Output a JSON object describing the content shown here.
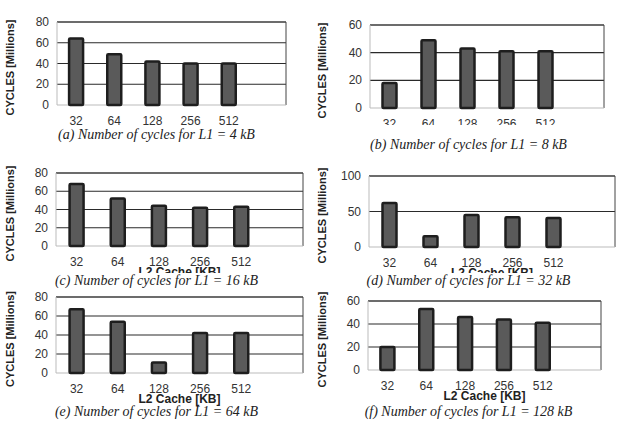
{
  "chart_data": [
    {
      "id": "a",
      "type": "bar",
      "title": "(a) Number of cycles for L1 = 4 kB",
      "xlabel": "L2 Cache [KB]",
      "ylabel": "CYCLES [Millions]",
      "categories": [
        "32",
        "64",
        "128",
        "256",
        "512"
      ],
      "values": [
        64,
        49,
        42,
        40,
        40
      ],
      "ylim": [
        0,
        80
      ],
      "yticks": [
        0,
        20,
        40,
        60,
        80
      ],
      "grid": true,
      "legend": null
    },
    {
      "id": "b",
      "type": "bar",
      "title": "(b) Number of cycles for L1 = 8 kB",
      "xlabel": "L2 Cache [KB]",
      "ylabel": "CYCLES [Millions]",
      "categories": [
        "32",
        "64",
        "128",
        "256",
        "512"
      ],
      "values": [
        18,
        49,
        43,
        41,
        41
      ],
      "ylim": [
        0,
        60
      ],
      "yticks": [
        0,
        20,
        40,
        60
      ],
      "grid": true,
      "legend": null
    },
    {
      "id": "c",
      "type": "bar",
      "title": "(c) Number of cycles for L1 = 16 kB",
      "xlabel": "L2 Cache [KB]",
      "ylabel": "CYCLES [Millions]",
      "categories": [
        "32",
        "64",
        "128",
        "256",
        "512"
      ],
      "values": [
        68,
        52,
        44,
        42,
        43
      ],
      "ylim": [
        0,
        80
      ],
      "yticks": [
        0,
        20,
        40,
        60,
        80
      ],
      "grid": true,
      "legend": null
    },
    {
      "id": "d",
      "type": "bar",
      "title": "(d) Number of cycles for L1 = 32 kB",
      "xlabel": "L2 Cache [KB]",
      "ylabel": "CYCLES [Millions]",
      "categories": [
        "32",
        "64",
        "128",
        "256",
        "512"
      ],
      "values": [
        62,
        15,
        45,
        42,
        41
      ],
      "ylim": [
        0,
        100
      ],
      "yticks": [
        0,
        50,
        100
      ],
      "grid": true,
      "legend": null
    },
    {
      "id": "e",
      "type": "bar",
      "title": "(e) Number of cycles for L1 = 64 kB",
      "xlabel": "L2 Cache [KB]",
      "ylabel": "CYCLES [Millions]",
      "categories": [
        "32",
        "64",
        "128",
        "256",
        "512"
      ],
      "values": [
        67,
        54,
        11,
        42,
        42
      ],
      "ylim": [
        0,
        80
      ],
      "yticks": [
        0,
        20,
        40,
        60,
        80
      ],
      "grid": true,
      "legend": null
    },
    {
      "id": "f",
      "type": "bar",
      "title": "(f) Number of cycles for L1 = 128 kB",
      "xlabel": "L2 Cache [KB]",
      "ylabel": "CYCLES [Millions]",
      "categories": [
        "32",
        "64",
        "128",
        "256",
        "512"
      ],
      "values": [
        20,
        53,
        46,
        44,
        41
      ],
      "ylim": [
        0,
        60
      ],
      "yticks": [
        0,
        20,
        40,
        60
      ],
      "grid": true,
      "legend": null
    }
  ],
  "style": {
    "bar_fill": "#5a5a5a",
    "bar_stroke": "#1e1e1e",
    "grid_color": "#2a2a2a",
    "axis_color": "#444444"
  }
}
